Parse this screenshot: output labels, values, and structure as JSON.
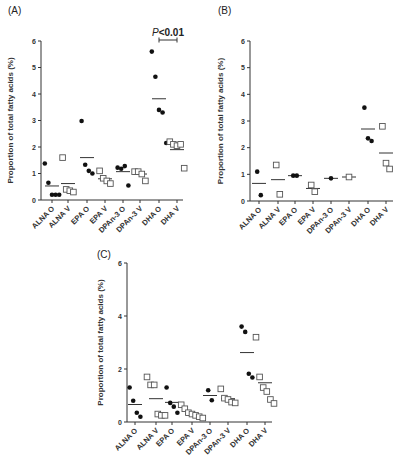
{
  "figure": {
    "panels": [
      "(A)",
      "(B)",
      "(C)"
    ],
    "ylabel": "Proportion of total fatty acids (%)",
    "annotation": {
      "panel": "(A)",
      "text_italic": "P",
      "text": "<0.01",
      "between": [
        "DHA O",
        "DHA V"
      ]
    }
  },
  "chart_data": [
    {
      "type": "scatter",
      "title": "(A)",
      "xlabel": "",
      "ylabel": "Proportion of total fatty acids (%)",
      "ylim": [
        0,
        6
      ],
      "yticks": [
        0,
        1,
        2,
        3,
        4,
        5,
        6
      ],
      "grid": false,
      "categories": [
        "ALNA O",
        "ALNA V",
        "EPA O",
        "EPA V",
        "DPAn-3 O",
        "DPAn-3 V",
        "DHA O",
        "DHA V"
      ],
      "marker": [
        "filled-circle",
        "open-square",
        "filled-circle",
        "open-square",
        "filled-circle",
        "open-square",
        "filled-circle",
        "open-square"
      ],
      "points": [
        [
          1.38,
          0.65,
          0.2,
          0.2,
          0.2
        ],
        [
          1.6,
          0.4,
          0.35,
          0.3
        ],
        [
          2.98,
          1.33,
          1.1,
          1.0
        ],
        [
          1.1,
          0.82,
          0.72,
          0.62
        ],
        [
          1.22,
          1.18,
          1.28,
          0.55
        ],
        [
          1.07,
          1.07,
          0.98,
          0.72
        ],
        [
          5.6,
          4.65,
          3.4,
          3.3,
          2.15
        ],
        [
          2.2,
          2.1,
          2.05,
          2.1,
          1.2
        ]
      ],
      "means": [
        0.53,
        0.62,
        1.6,
        0.8,
        1.07,
        0.98,
        3.82,
        1.9
      ],
      "annotations": [
        "P<0.01 (DHA O vs DHA V)"
      ]
    },
    {
      "type": "scatter",
      "title": "(B)",
      "xlabel": "",
      "ylabel": "Proportion of total fatty acids (%)",
      "ylim": [
        0,
        6
      ],
      "yticks": [
        0,
        1,
        2,
        3,
        4,
        5,
        6
      ],
      "grid": false,
      "categories": [
        "ALNA O",
        "ALNA V",
        "EPA O",
        "EPA V",
        "DPAn-3 O",
        "DPAn-3 V",
        "DHA O",
        "DHA V"
      ],
      "marker": [
        "filled-circle",
        "open-square",
        "filled-circle",
        "open-square",
        "filled-circle",
        "open-square",
        "filled-circle",
        "open-square"
      ],
      "points": [
        [
          1.1,
          0.22
        ],
        [
          1.35,
          0.25
        ],
        [
          0.95,
          0.95
        ],
        [
          0.6,
          0.35
        ],
        [
          0.85
        ],
        [
          0.9
        ],
        [
          3.5,
          2.35,
          2.25
        ],
        [
          2.8,
          1.42,
          1.2
        ]
      ],
      "means": [
        0.66,
        0.8,
        0.95,
        0.47,
        0.85,
        0.9,
        2.7,
        1.8
      ]
    },
    {
      "type": "scatter",
      "title": "(C)",
      "xlabel": "",
      "ylabel": "Proportion of total fatty acids (%)",
      "ylim": [
        0,
        6
      ],
      "yticks": [
        0,
        2,
        4,
        6
      ],
      "grid": false,
      "categories": [
        "ALNA O",
        "ALNA V",
        "EPA O",
        "EPA V",
        "DPAn-3 O",
        "DPAn-3 V",
        "DHA O",
        "DHA V"
      ],
      "marker": [
        "filled-circle",
        "open-square",
        "filled-circle",
        "open-square",
        "filled-circle",
        "open-square",
        "filled-circle",
        "open-square"
      ],
      "points": [
        [
          1.3,
          0.8,
          0.35,
          0.2
        ],
        [
          1.7,
          1.4,
          1.4,
          0.3,
          0.25,
          0.25
        ],
        [
          1.3,
          0.72,
          0.58,
          0.35
        ],
        [
          0.65,
          0.5,
          0.35,
          0.3,
          0.25,
          0.2,
          0.15
        ],
        [
          1.2,
          0.82
        ],
        [
          1.25,
          0.9,
          0.85,
          0.75,
          0.72
        ],
        [
          3.6,
          3.4,
          1.82,
          1.68
        ],
        [
          3.2,
          1.7,
          1.3,
          1.15,
          0.85,
          0.7
        ]
      ],
      "means": [
        0.66,
        0.88,
        0.74,
        0.3,
        1.0,
        0.88,
        2.62,
        1.48
      ]
    }
  ],
  "layout": {
    "panels": [
      {
        "label_x": 8,
        "label_y": 14,
        "axis_x": 41,
        "axis_right": 183,
        "y0": 200,
        "y6": 41,
        "cat_x": [
          52,
          68,
          87,
          105,
          123,
          140,
          159,
          177
        ],
        "title_x": 13
      },
      {
        "label_x": 218,
        "label_y": 14,
        "axis_x": 250,
        "axis_right": 393,
        "y0": 201,
        "y6": 41,
        "cat_x": [
          259,
          278,
          295,
          313,
          331,
          349,
          368,
          386
        ],
        "title_x": 223
      },
      {
        "label_x": 97,
        "label_y": 258,
        "axis_x": 127,
        "axis_right": 272,
        "y0": 422,
        "y6": 263,
        "cat_x": [
          135,
          156,
          172,
          192,
          210,
          228,
          247,
          265
        ],
        "title_x": 103
      }
    ]
  }
}
